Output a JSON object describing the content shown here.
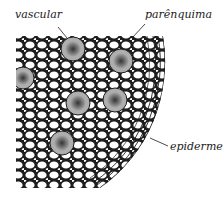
{
  "figure": {
    "labels": {
      "vascular": "vascular",
      "parenchyma": "parênquima",
      "epidermis": "epiderme"
    },
    "colors": {
      "ink": "#1e1e1e",
      "paper": "#ffffff"
    }
  }
}
